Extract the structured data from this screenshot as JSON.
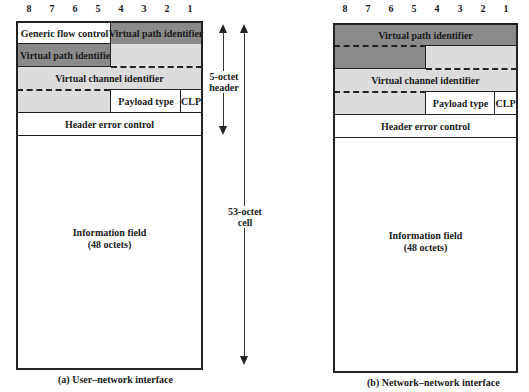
{
  "bit_numbers": [
    "8",
    "7",
    "6",
    "5",
    "4",
    "3",
    "2",
    "1"
  ],
  "uni": {
    "caption": "(a) User–network interface",
    "fields": {
      "gfc": "Generic flow control",
      "vpi_upper": "Virtual path identifier",
      "vpi_lower": "Virtual path identifier",
      "vci": "Virtual channel identifier",
      "pt": "Payload type",
      "clp": "CLP",
      "hec": "Header error control",
      "info_line1": "Information field",
      "info_line2": "(48 octets)"
    }
  },
  "nni": {
    "caption": "(b) Network–network interface",
    "fields": {
      "vpi": "Virtual path identifier",
      "vci": "Virtual channel identifier",
      "pt": "Payload type",
      "clp": "CLP",
      "hec": "Header error control",
      "info_line1": "Information field",
      "info_line2": "(48 octets)"
    }
  },
  "annotations": {
    "header_line1": "5-octet",
    "header_line2": "header",
    "cell_line1": "53-octet",
    "cell_line2": "cell"
  },
  "colors": {
    "dark_fill": "#8a8a8a",
    "light_fill": "#dcdcdc",
    "line": "#222222"
  }
}
